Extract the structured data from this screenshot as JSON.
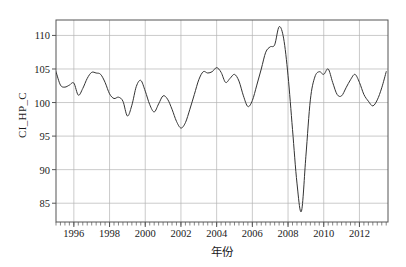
{
  "chart_data": {
    "type": "line",
    "title": "",
    "xlabel": "年份",
    "ylabel": "CI_HP_C",
    "xlim": [
      1995.0,
      1913.0
    ],
    "x_axis_range": [
      1995.0,
      2013.6
    ],
    "ylim": [
      82.2,
      112.3
    ],
    "grid": true,
    "legend": "none",
    "line_color": "#333333",
    "background_color": "#ffffff",
    "grid_color": "#b3b3b3",
    "axis_color": "#555555",
    "x_ticks_major": [
      1996,
      1998,
      2000,
      2002,
      2004,
      2006,
      2008,
      2010,
      2012
    ],
    "x_tick_labels": [
      "1996",
      "1998",
      "2000",
      "2002",
      "2004",
      "2006",
      "2008",
      "2010",
      "2012"
    ],
    "x_minor_tick_interval": 0.25,
    "y_ticks": [
      85,
      90,
      95,
      100,
      105,
      110
    ],
    "y_tick_labels": [
      "85",
      "90",
      "95",
      "100",
      "105",
      "110"
    ],
    "series": [
      {
        "name": "CI_HP_C",
        "x": [
          1995.0,
          1995.25,
          1995.5,
          1995.75,
          1996.0,
          1996.25,
          1996.5,
          1996.75,
          1997.0,
          1997.25,
          1997.5,
          1997.75,
          1998.0,
          1998.25,
          1998.5,
          1998.75,
          1999.0,
          1999.25,
          1999.5,
          1999.75,
          2000.0,
          2000.25,
          2000.5,
          2000.75,
          2001.0,
          2001.25,
          2001.5,
          2001.75,
          2002.0,
          2002.25,
          2002.5,
          2002.75,
          2003.0,
          2003.25,
          2003.5,
          2003.75,
          2004.0,
          2004.25,
          2004.5,
          2004.75,
          2005.0,
          2005.25,
          2005.5,
          2005.75,
          2006.0,
          2006.25,
          2006.5,
          2006.75,
          2007.0,
          2007.25,
          2007.5,
          2007.75,
          2008.0,
          2008.25,
          2008.5,
          2008.75,
          2009.0,
          2009.25,
          2009.5,
          2009.75,
          2010.0,
          2010.25,
          2010.5,
          2010.75,
          2011.0,
          2011.25,
          2011.5,
          2011.75,
          2012.0,
          2012.25,
          2012.5,
          2012.75,
          2013.0,
          2013.25,
          2013.5
        ],
        "values": [
          104.6,
          102.6,
          102.3,
          102.6,
          102.9,
          101.1,
          102.1,
          103.6,
          104.5,
          104.4,
          104.2,
          103.0,
          101.3,
          100.6,
          100.8,
          100.2,
          98.0,
          99.6,
          102.4,
          103.3,
          101.7,
          99.7,
          98.6,
          99.8,
          101.0,
          100.5,
          99.0,
          97.2,
          96.2,
          97.0,
          99.0,
          101.2,
          103.4,
          104.6,
          104.4,
          104.6,
          105.2,
          104.5,
          103.0,
          103.6,
          104.2,
          103.2,
          101.0,
          99.4,
          100.3,
          102.6,
          105.0,
          107.5,
          108.3,
          108.6,
          111.3,
          109.6,
          104.0,
          96.0,
          88.0,
          83.8,
          92.0,
          100.4,
          103.8,
          104.6,
          104.2,
          105.0,
          103.0,
          101.2,
          101.0,
          102.2,
          103.4,
          104.2,
          103.0,
          101.2,
          100.2,
          99.5,
          100.4,
          102.2,
          104.6
        ]
      }
    ],
    "annotations": {
      "peak": {
        "x": 2007.5,
        "y": 111.3,
        "label": "peak"
      },
      "trough": {
        "x": 2008.75,
        "y": 83.8,
        "label": "2008 financial crisis trough"
      }
    }
  },
  "axes": {
    "y_title": "CI_HP_C",
    "x_title": "年份"
  }
}
